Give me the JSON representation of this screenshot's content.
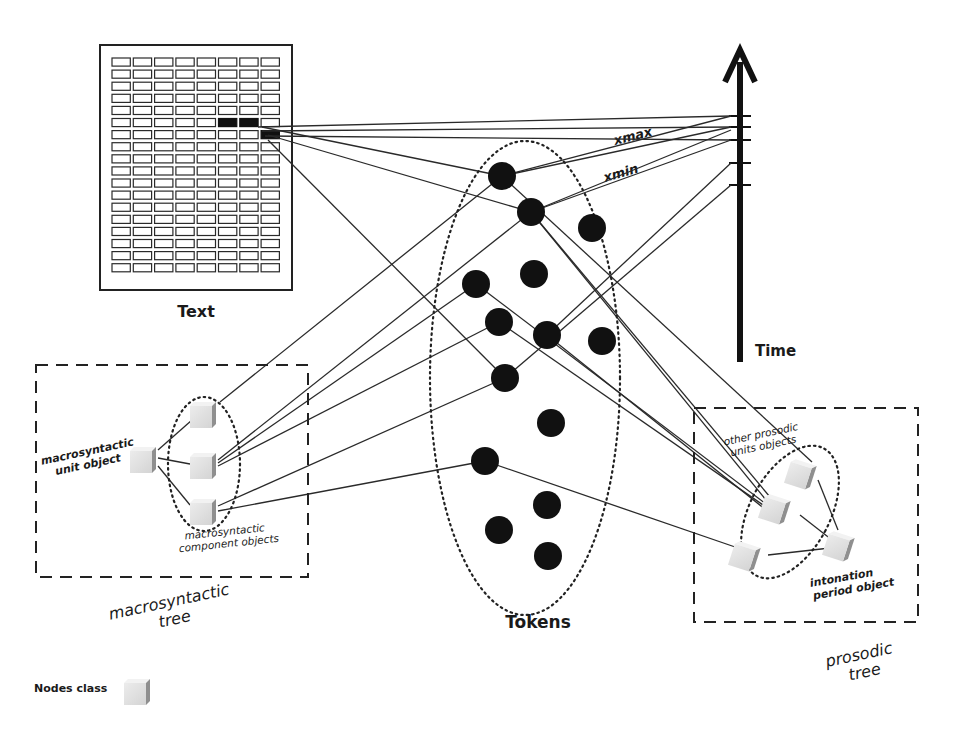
{
  "labels": {
    "text": "Text",
    "tokens": "Tokens",
    "time": "Time",
    "xmax": "xmax",
    "xmin": "xmin",
    "macro_unit_line1": "macrosyntactic",
    "macro_unit_line2": "unit object",
    "macro_component_line1": "macrosyntactic",
    "macro_component_line2": "component objects",
    "macro_tree_line1": "macrosyntactic",
    "macro_tree_line2": "tree",
    "other_prosodic_line1": "other prosodic",
    "other_prosodic_line2": "units objects",
    "intonation_line1": "intonation",
    "intonation_line2": "period object",
    "prosodic_tree_line1": "prosodic",
    "prosodic_tree_line2": "tree",
    "legend": "Nodes class"
  },
  "colors": {
    "ink": "#111111",
    "node_light": "#e2e2e2",
    "node_dark": "#9a9a9a",
    "background": "#ffffff"
  },
  "text_grid": {
    "rows": 18,
    "cols": 8
  }
}
